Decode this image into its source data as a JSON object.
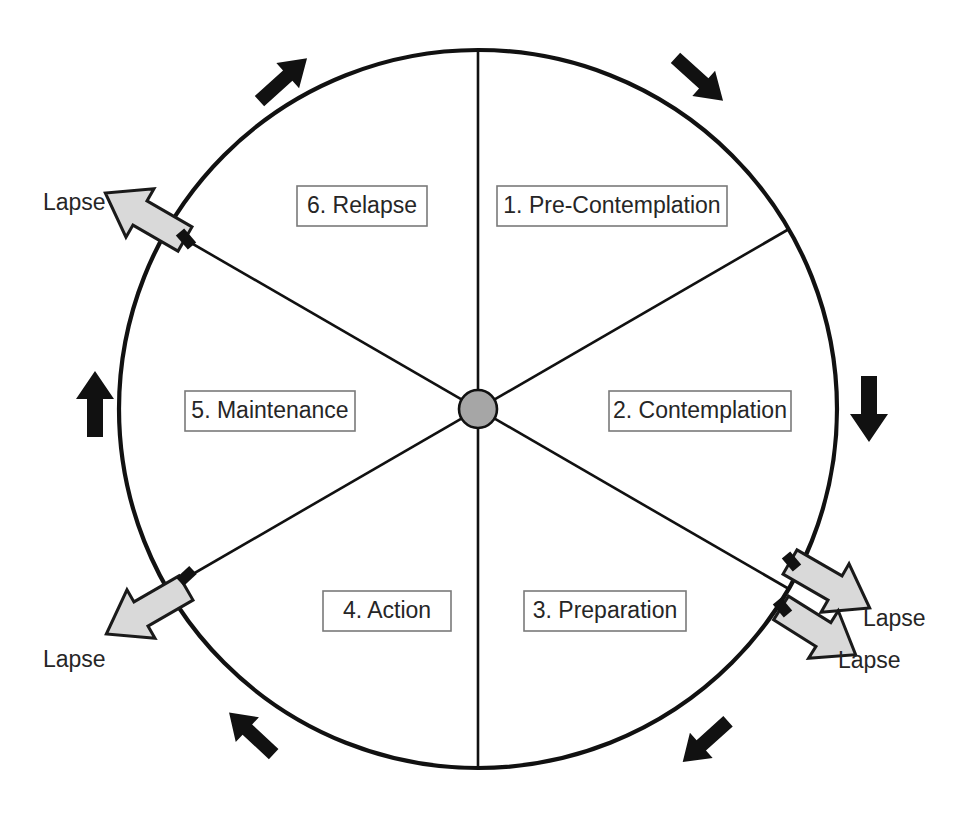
{
  "diagram": {
    "type": "cycle-wheel",
    "geometry": {
      "center_x": 478,
      "center_y": 409,
      "radius": 359,
      "hub_radius": 19,
      "segment_count": 6
    },
    "colors": {
      "rim_stroke": "#111111",
      "spoke_stroke": "#111111",
      "hub_fill": "#a6a6a6",
      "label_box_fill": "#ffffff",
      "label_box_stroke": "#7a7a7a",
      "label_text": "#262626",
      "lapse_arrow_fill": "#d9d9d9",
      "lapse_arrow_stroke": "#1a1a1a",
      "flow_arrow_fill": "#111111",
      "background": "#ffffff"
    },
    "stages": [
      {
        "id": "pre-contemplation",
        "number": "1.",
        "name": "Pre-Contemplation",
        "label": "1. Pre-Contemplation",
        "box_x": 497,
        "box_y": 186,
        "box_w": 230,
        "box_h": 40,
        "sector_deg": [
          30,
          90
        ]
      },
      {
        "id": "contemplation",
        "number": "2.",
        "name": "Contemplation",
        "label": "2. Contemplation",
        "box_x": 609,
        "box_y": 391,
        "box_w": 182,
        "box_h": 40,
        "sector_deg": [
          -30,
          30
        ]
      },
      {
        "id": "preparation",
        "number": "3.",
        "name": "Preparation",
        "label": "3. Preparation",
        "box_x": 524,
        "box_y": 591,
        "box_w": 162,
        "box_h": 40,
        "sector_deg": [
          -90,
          -30
        ]
      },
      {
        "id": "action",
        "number": "4.",
        "name": "Action",
        "label": "4. Action",
        "box_x": 323,
        "box_y": 591,
        "box_w": 128,
        "box_h": 40,
        "sector_deg": [
          -150,
          -90
        ]
      },
      {
        "id": "maintenance",
        "number": "5.",
        "name": "Maintenance",
        "label": "5. Maintenance",
        "box_x": 185,
        "box_y": 391,
        "box_w": 170,
        "box_h": 40,
        "sector_deg": [
          150,
          210
        ]
      },
      {
        "id": "relapse",
        "number": "6.",
        "name": "Relapse",
        "label": "6. Relapse",
        "box_x": 297,
        "box_y": 186,
        "box_w": 130,
        "box_h": 40,
        "sector_deg": [
          90,
          150
        ]
      }
    ],
    "lapse_arrows": [
      {
        "id": "lapse-upper-left",
        "label": "Lapse",
        "label_x": 43,
        "label_y": 204,
        "origin_deg": 120,
        "direction": "out-upper-left"
      },
      {
        "id": "lapse-lower-left",
        "label": "Lapse",
        "label_x": 43,
        "label_y": 661,
        "origin_deg": 210,
        "direction": "out-lower-left"
      },
      {
        "id": "lapse-right-upper",
        "label": "Lapse",
        "label_x": 863,
        "label_y": 620,
        "origin_deg": -30,
        "direction": "out-lower-right"
      },
      {
        "id": "lapse-right-lower",
        "label": "Lapse",
        "label_x": 838,
        "label_y": 662,
        "origin_deg": -42,
        "direction": "out-lower-right"
      }
    ],
    "flow_arrows": [
      {
        "id": "flow-top-left",
        "position_deg": 118,
        "points": "up-right",
        "cx": 284,
        "cy": 79
      },
      {
        "id": "flow-top-right",
        "position_deg": 62,
        "points": "down-right",
        "cx": 700,
        "cy": 80
      },
      {
        "id": "flow-right",
        "position_deg": 0,
        "points": "down",
        "cx": 869,
        "cy": 409
      },
      {
        "id": "flow-bottom-right",
        "position_deg": -62,
        "points": "down-left",
        "cx": 705,
        "cy": 742
      },
      {
        "id": "flow-bottom-left",
        "position_deg": -118,
        "points": "up-left",
        "cx": 251,
        "cy": 733
      },
      {
        "id": "flow-left",
        "position_deg": 180,
        "points": "up",
        "cx": 95,
        "cy": 404
      }
    ],
    "flow_direction": "clockwise"
  }
}
